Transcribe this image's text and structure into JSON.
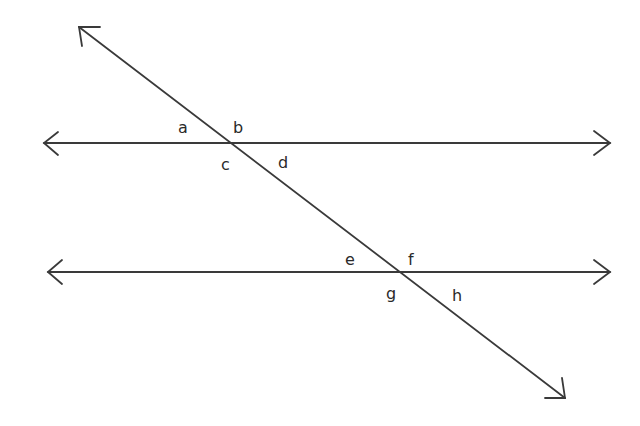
{
  "diagram": {
    "type": "parallel-lines-transversal",
    "lines": {
      "top_parallel": {
        "y": 143,
        "x1": 44,
        "x2": 610
      },
      "bottom_parallel": {
        "y": 272,
        "x1": 48,
        "x2": 610
      },
      "transversal": {
        "x1": 79,
        "y1": 27,
        "x2": 565,
        "y2": 398
      }
    },
    "intersections": [
      {
        "name": "upper",
        "x": 233,
        "y": 143
      },
      {
        "name": "lower",
        "x": 403,
        "y": 272
      }
    ],
    "angle_labels": [
      {
        "text": "a",
        "x": 184,
        "y": 132
      },
      {
        "text": "b",
        "x": 236,
        "y": 132
      },
      {
        "text": "c",
        "x": 222,
        "y": 168
      },
      {
        "text": "d",
        "x": 279,
        "y": 166
      },
      {
        "text": "e",
        "x": 346,
        "y": 264
      },
      {
        "text": "f",
        "x": 409,
        "y": 262
      },
      {
        "text": "g",
        "x": 387,
        "y": 300
      },
      {
        "text": "h",
        "x": 453,
        "y": 301
      }
    ],
    "colors": {
      "line": "#3a3a3a",
      "label": "#2a2a2a",
      "background": "#ffffff"
    }
  }
}
